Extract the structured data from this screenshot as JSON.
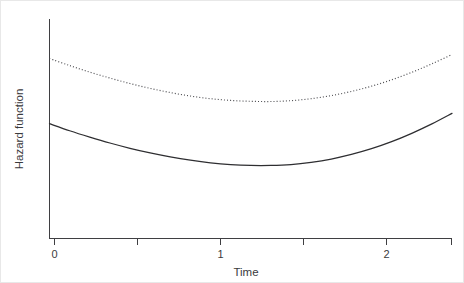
{
  "chart_data": {
    "type": "line",
    "title": "",
    "subtitle": "",
    "xlabel": "Time",
    "ylabel": "Hazard function",
    "xlim": [
      0,
      2.4
    ],
    "ylim": [
      0,
      1
    ],
    "grid": false,
    "legend": "none",
    "annotations": [],
    "x_ticks": {
      "major_values": [
        0,
        1,
        2
      ],
      "major_labels": [
        "0",
        "1",
        "2"
      ],
      "minor_values": [
        0.5,
        1.5,
        2.4
      ]
    },
    "y_ticks": {
      "major_values": [],
      "major_labels": []
    },
    "series": [
      {
        "name": "upper-hazard-dotted",
        "style": "dotted",
        "color": "#4a4a4e",
        "x": [
          0.0,
          0.12,
          0.24,
          0.36,
          0.48,
          0.6,
          0.72,
          0.84,
          0.96,
          1.08,
          1.2,
          1.32,
          1.44,
          1.56,
          1.68,
          1.8,
          1.92,
          2.04,
          2.16,
          2.28,
          2.4
        ],
        "y": [
          0.82,
          0.788,
          0.758,
          0.731,
          0.706,
          0.684,
          0.665,
          0.649,
          0.637,
          0.629,
          0.625,
          0.624,
          0.628,
          0.637,
          0.651,
          0.67,
          0.694,
          0.723,
          0.757,
          0.796,
          0.838
        ]
      },
      {
        "name": "lower-hazard-solid",
        "style": "solid",
        "color": "#2e2e31",
        "x": [
          0.0,
          0.12,
          0.24,
          0.36,
          0.48,
          0.6,
          0.72,
          0.84,
          0.96,
          1.08,
          1.2,
          1.32,
          1.44,
          1.56,
          1.68,
          1.8,
          1.92,
          2.04,
          2.16,
          2.28,
          2.4
        ],
        "y": [
          0.523,
          0.491,
          0.462,
          0.435,
          0.411,
          0.39,
          0.372,
          0.357,
          0.345,
          0.337,
          0.333,
          0.333,
          0.337,
          0.347,
          0.362,
          0.383,
          0.409,
          0.441,
          0.479,
          0.522,
          0.57
        ]
      }
    ]
  },
  "axes": {
    "y_axis_label": "Hazard function",
    "x_axis_label": "Time"
  },
  "tick_labels": {
    "x0": "0",
    "x1": "1",
    "x2": "2"
  },
  "colors": {
    "background": "#ffffff",
    "axis": "#3f3f42",
    "solid_curve": "#2e2e31",
    "dotted_curve": "#4a4a4e",
    "text": "#3a3a3d"
  }
}
